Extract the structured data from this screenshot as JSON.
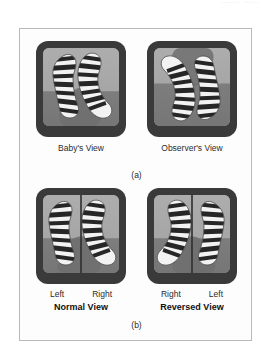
{
  "header": {
    "faint_text": "….…  ……"
  },
  "figure": {
    "panels_a": [
      {
        "id": "babys-view",
        "caption": "Baby's View",
        "orientation": "upright",
        "split": false
      },
      {
        "id": "observers-view",
        "caption": "Observer's View",
        "orientation": "inverted",
        "split": false
      }
    ],
    "subfigure_a_label": "(a)",
    "panels_b": [
      {
        "id": "normal-view",
        "left_label": "Left",
        "right_label": "Right",
        "view_name": "Normal View",
        "orientation": "upright",
        "split": true
      },
      {
        "id": "reversed-view",
        "left_label": "Right",
        "right_label": "Left",
        "view_name": "Reversed View",
        "orientation": "mirrored",
        "split": true
      }
    ],
    "subfigure_b_label": "(b)"
  },
  "colors": {
    "page_background": "#ffffff",
    "figure_border": "#b9b9b9",
    "frame_dark": "#3a3a3a",
    "screen_upper": "#a8a8a8",
    "screen_lower": "#7e7e7e",
    "stripe_light": "#f4f4f4",
    "stripe_dark": "#2a2a2a",
    "text": "#2b2b2b"
  }
}
